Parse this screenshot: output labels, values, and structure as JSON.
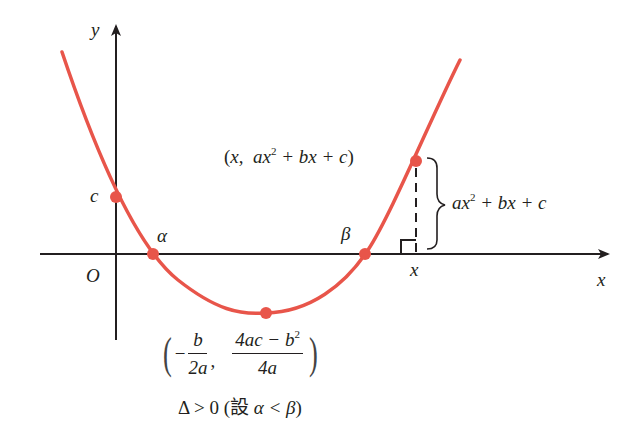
{
  "diagram": {
    "colors": {
      "curve": "#e8554a",
      "axes": "#231f20",
      "text": "#231f20"
    },
    "axes": {
      "x_label": "x",
      "y_label": "y",
      "origin_label": "O"
    },
    "points": {
      "y_intercept": "c",
      "root_left": "α",
      "root_right": "β",
      "x_marker": "x"
    },
    "point_label": {
      "open": "(",
      "x": "x",
      "comma": ",",
      "expr_a": "ax",
      "exp": "2",
      "expr_rest": "+ bx + c",
      "close": ")"
    },
    "brace_label": {
      "expr_a": "ax",
      "exp": "2",
      "expr_rest": "+ bx + c"
    },
    "vertex_label": {
      "open": "(",
      "minus": "−",
      "frac1_num": "b",
      "frac1_den": "2a",
      "comma": ",",
      "frac2_num_a": "4ac − b",
      "frac2_num_exp": "2",
      "frac2_den": "4a",
      "close": ")"
    },
    "condition": {
      "delta": "Δ > 0",
      "note_open": "(設",
      "note_var": "α < β",
      "note_close": ")"
    }
  }
}
